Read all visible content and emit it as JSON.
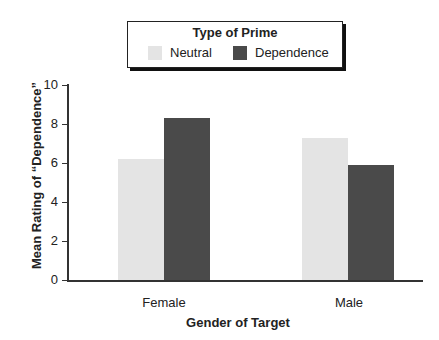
{
  "chart_data": {
    "type": "bar",
    "title": "",
    "legend_title": "Type of Prime",
    "categories": [
      "Female",
      "Male"
    ],
    "series": [
      {
        "name": "Neutral",
        "values": [
          6.2,
          7.3
        ],
        "color": "#e4e4e4"
      },
      {
        "name": "Dependence",
        "values": [
          8.3,
          5.9
        ],
        "color": "#4a4a4a"
      }
    ],
    "xlabel": "Gender of Target",
    "ylabel": "Mean Rating of “Dependence”",
    "ylim": [
      0,
      10
    ],
    "yticks": [
      "0",
      "2",
      "4",
      "6",
      "8",
      "10"
    ],
    "grid": false,
    "legend_position": "top-center"
  }
}
